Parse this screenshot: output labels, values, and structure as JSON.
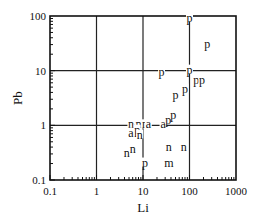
{
  "chart_data": {
    "type": "scatter",
    "title": "",
    "xlabel": "Li",
    "ylabel": "Pb",
    "xscale": "log",
    "yscale": "log",
    "xlim": [
      0.1,
      1000
    ],
    "ylim": [
      0.1,
      100
    ],
    "grid": "major decades (1, 10, 100 lines)",
    "legend": "none",
    "x_ticks": [
      "0.1",
      "1",
      "10",
      "100",
      "1000"
    ],
    "y_ticks": [
      "0.1",
      "1",
      "10",
      "100"
    ],
    "marker_note": "Points plotted as letters: p, n, a, m",
    "points": [
      {
        "label": "p",
        "li": 100,
        "pb": 90
      },
      {
        "label": "p",
        "li": 240,
        "pb": 30
      },
      {
        "label": "p",
        "li": 25,
        "pb": 9
      },
      {
        "label": "p",
        "li": 100,
        "pb": 10
      },
      {
        "label": "p",
        "li": 140,
        "pb": 6.5
      },
      {
        "label": "p",
        "li": 185,
        "pb": 6.5
      },
      {
        "label": "p",
        "li": 80,
        "pb": 4.5
      },
      {
        "label": "p",
        "li": 50,
        "pb": 3.5
      },
      {
        "label": "a",
        "li": 27,
        "pb": 1.0
      },
      {
        "label": "p",
        "li": 35,
        "pb": 1.2
      },
      {
        "label": "p",
        "li": 45,
        "pb": 1.5
      },
      {
        "label": "n",
        "li": 5.5,
        "pb": 1.0
      },
      {
        "label": "n",
        "li": 8,
        "pb": 1.0
      },
      {
        "label": "n",
        "li": 11,
        "pb": 1.0
      },
      {
        "label": "a",
        "li": 13,
        "pb": 1.0
      },
      {
        "label": "a",
        "li": 5.5,
        "pb": 0.7
      },
      {
        "label": "p",
        "li": 7.5,
        "pb": 0.8
      },
      {
        "label": "n",
        "li": 8.5,
        "pb": 0.65
      },
      {
        "label": "n",
        "li": 4.5,
        "pb": 0.3
      },
      {
        "label": "n",
        "li": 6,
        "pb": 0.35
      },
      {
        "label": "p",
        "li": 11,
        "pb": 0.2
      },
      {
        "label": "n",
        "li": 36,
        "pb": 0.38
      },
      {
        "label": "n",
        "li": 75,
        "pb": 0.38
      },
      {
        "label": "m",
        "li": 36,
        "pb": 0.2
      }
    ]
  }
}
